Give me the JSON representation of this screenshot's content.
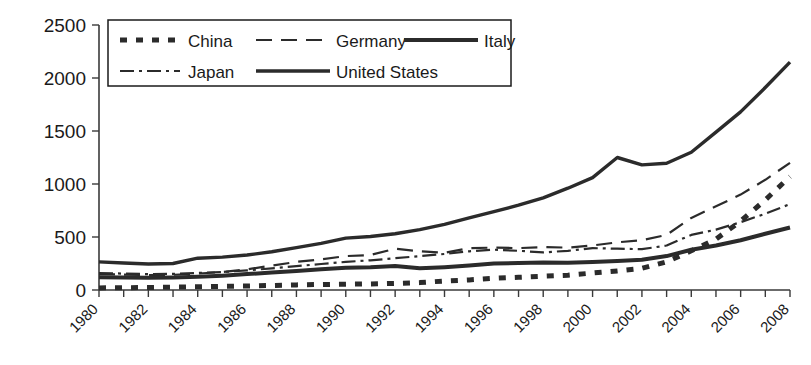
{
  "chart_data": {
    "type": "line",
    "title": "",
    "xlabel": "",
    "ylabel": "",
    "xlim": [
      1980,
      2008
    ],
    "ylim": [
      0,
      2500
    ],
    "grid": false,
    "legend_position": "top-left-inside",
    "y_ticks": [
      "0",
      "500",
      "1000",
      "1500",
      "2000",
      "2500"
    ],
    "y_tick_values": [
      0,
      500,
      1000,
      1500,
      2000,
      2500
    ],
    "x_ticks": [
      "1980",
      "1982",
      "1984",
      "1986",
      "1988",
      "1990",
      "1992",
      "1994",
      "1996",
      "1998",
      "2000",
      "2002",
      "2004",
      "2006",
      "2008"
    ],
    "x_tick_values": [
      1980,
      1982,
      1984,
      1986,
      1988,
      1990,
      1992,
      1994,
      1996,
      1998,
      2000,
      2002,
      2004,
      2006,
      2008
    ],
    "x": [
      1980,
      1981,
      1982,
      1983,
      1984,
      1985,
      1986,
      1987,
      1988,
      1989,
      1990,
      1991,
      1992,
      1993,
      1994,
      1995,
      1996,
      1997,
      1998,
      1999,
      2000,
      2001,
      2002,
      2003,
      2004,
      2005,
      2006,
      2007,
      2008
    ],
    "series": [
      {
        "name": "China",
        "dash": "dotted-thick",
        "stroke_width": 5,
        "dasharray": "7,9",
        "values": [
          20,
          22,
          24,
          26,
          30,
          35,
          38,
          42,
          48,
          52,
          55,
          58,
          62,
          70,
          85,
          95,
          110,
          120,
          130,
          140,
          160,
          180,
          205,
          265,
          370,
          480,
          650,
          850,
          1070
        ]
      },
      {
        "name": "Germany",
        "dash": "long-dash",
        "stroke_width": 2.2,
        "dasharray": "16,9",
        "values": [
          150,
          145,
          140,
          143,
          155,
          170,
          195,
          230,
          265,
          290,
          320,
          330,
          390,
          365,
          350,
          395,
          400,
          395,
          405,
          400,
          420,
          450,
          470,
          520,
          680,
          790,
          900,
          1040,
          1200
        ]
      },
      {
        "name": "Italy",
        "dash": "solid-thick",
        "stroke_width": 4,
        "dasharray": "none",
        "values": [
          120,
          118,
          115,
          118,
          125,
          135,
          150,
          165,
          180,
          195,
          210,
          215,
          225,
          205,
          215,
          230,
          250,
          255,
          260,
          258,
          265,
          275,
          285,
          320,
          380,
          420,
          470,
          530,
          590
        ]
      },
      {
        "name": "Japan",
        "dash": "dash-dot",
        "stroke_width": 2.2,
        "dasharray": "14,5,3,5",
        "values": [
          160,
          155,
          150,
          152,
          160,
          170,
          185,
          205,
          225,
          245,
          265,
          280,
          300,
          320,
          340,
          365,
          380,
          370,
          355,
          370,
          395,
          390,
          385,
          420,
          520,
          570,
          640,
          720,
          810
        ]
      },
      {
        "name": "United States",
        "dash": "solid",
        "stroke_width": 3.4,
        "dasharray": "none",
        "values": [
          265,
          255,
          245,
          250,
          300,
          310,
          330,
          360,
          400,
          440,
          490,
          505,
          530,
          570,
          620,
          680,
          740,
          800,
          870,
          960,
          1060,
          1250,
          1180,
          1195,
          1300,
          1490,
          1680,
          1910,
          2150
        ]
      }
    ],
    "legend": [
      {
        "label": "China",
        "style": "dotted-thick"
      },
      {
        "label": "Germany",
        "style": "long-dash"
      },
      {
        "label": "Italy",
        "style": "solid-thick"
      },
      {
        "label": "Japan",
        "style": "dash-dot"
      },
      {
        "label": "United States",
        "style": "solid"
      }
    ]
  }
}
